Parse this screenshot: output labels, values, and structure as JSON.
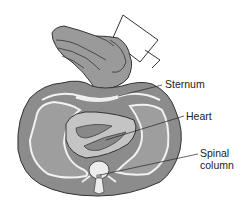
{
  "diagram": {
    "labels": [
      {
        "id": "sternum",
        "text": "Sternum"
      },
      {
        "id": "heart",
        "text": "Heart"
      },
      {
        "id": "spinal_line1",
        "text": "Spinal"
      },
      {
        "id": "spinal_line2",
        "text": "column"
      }
    ],
    "colors": {
      "body_fill": "#8c8c8c",
      "inner_fill": "#a6a6a6",
      "lung_outline": "#f2f2f2",
      "heart_fill": "#c4c4c4",
      "hand_fill": "#9a9a9a",
      "outline": "#333333"
    }
  }
}
